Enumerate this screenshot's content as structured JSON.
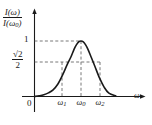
{
  "figure": {
    "kind": "resonance-curve-diagram",
    "colors": {
      "background": "#ffffff",
      "axis": "#1a1a1a",
      "curve": "#1a1a1a",
      "dashed": "#555555"
    }
  },
  "chart_data": {
    "type": "line",
    "title": "",
    "subtitle": "",
    "xlabel": "ω",
    "ylabel": "I(ω)/I(ω₀)",
    "xlim": [
      0,
      1.75
    ],
    "ylim": [
      0,
      1.18
    ],
    "grid": false,
    "legend_position": "none",
    "axis_arrows": {
      "x": true,
      "y": true
    },
    "y_ticks": [
      {
        "value": 1,
        "label": "1"
      },
      {
        "value": 0.7071,
        "label": "√2 / 2"
      }
    ],
    "x_ticks": [
      {
        "value": 0,
        "label": "0"
      },
      {
        "value": 0.78,
        "label": "ω₁"
      },
      {
        "value": 1.0,
        "label": "ω₀"
      },
      {
        "value": 1.22,
        "label": "ω₂"
      }
    ],
    "annotations": [
      {
        "text": "horizontal dashed line at y = 1 to the peak"
      },
      {
        "text": "horizontal dashed line at y = √2/2 (half-power level)"
      },
      {
        "text": "vertical dashed line at ω₁"
      },
      {
        "text": "vertical dashed line at ω₀ (peak)"
      },
      {
        "text": "vertical dashed line at ω₂"
      }
    ],
    "series": [
      {
        "name": "I(ω)/I(ω₀)",
        "x": [
          0.0,
          0.1,
          0.2,
          0.3,
          0.4,
          0.5,
          0.6,
          0.7,
          0.78,
          0.85,
          0.9,
          0.95,
          1.0,
          1.05,
          1.1,
          1.15,
          1.22,
          1.3,
          1.4,
          1.5,
          1.6,
          1.75
        ],
        "y": [
          0.0,
          0.012,
          0.03,
          0.065,
          0.12,
          0.22,
          0.38,
          0.57,
          0.707,
          0.85,
          0.93,
          0.985,
          1.0,
          0.985,
          0.93,
          0.85,
          0.707,
          0.54,
          0.33,
          0.165,
          0.06,
          0.01
        ]
      }
    ]
  },
  "labels": {
    "y_axis": {
      "numerator_fn": "I",
      "numerator_arg": "(ω)",
      "denominator_fn": "I",
      "denominator_arg": "(ω",
      "denominator_sub": "0",
      "denominator_close": ")"
    },
    "tick_one": "1",
    "tick_half": {
      "radical": "√",
      "radicand": "2",
      "denominator": "2"
    },
    "origin": "0",
    "omega_1": {
      "base": "ω",
      "sub": "1"
    },
    "omega_0": {
      "base": "ω",
      "sub": "0"
    },
    "omega_2": {
      "base": "ω",
      "sub": "2"
    },
    "x_axis": "ω"
  }
}
